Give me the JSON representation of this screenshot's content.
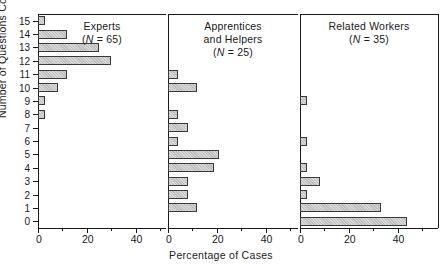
{
  "chart_data": {
    "type": "bar",
    "orientation": "horizontal",
    "title": "",
    "xlabel": "Percentage of Cases",
    "ylabel": "Number of Questions Correct",
    "xlim": [
      0,
      57
    ],
    "ylim": [
      -0.5,
      15.5
    ],
    "xticks": [
      0,
      20,
      40
    ],
    "xtick_labels": [
      "0",
      "20",
      "40"
    ],
    "x_minor_ticks": [
      10,
      30,
      50
    ],
    "yticks": [
      0,
      1,
      2,
      3,
      4,
      5,
      6,
      7,
      8,
      9,
      10,
      11,
      12,
      13,
      14,
      15
    ],
    "ytick_labels": [
      "0",
      "1",
      "2",
      "3",
      "4",
      "5",
      "6",
      "7",
      "8",
      "9",
      "10",
      "11",
      "12",
      "13",
      "14",
      "15"
    ],
    "grid": false,
    "legend": null,
    "categories": [
      0,
      1,
      2,
      3,
      4,
      5,
      6,
      7,
      8,
      9,
      10,
      11,
      12,
      13,
      14,
      15
    ],
    "panels": [
      {
        "name": "experts",
        "title_lines": [
          "Experts",
          "(N = 65)"
        ],
        "n_label": "(N = 65)",
        "n": 65,
        "values": [
          0,
          0,
          0,
          0,
          0,
          0,
          0,
          0,
          3,
          3,
          8,
          12,
          30,
          25,
          12,
          3
        ]
      },
      {
        "name": "apprentices-and-helpers",
        "title_lines": [
          "Apprentices",
          "and Helpers",
          "(N = 25)"
        ],
        "n_label": "(N = 25)",
        "n": 25,
        "values": [
          0,
          12,
          8,
          8,
          19,
          21,
          4,
          8,
          4,
          0,
          12,
          4,
          0,
          0,
          0,
          0
        ]
      },
      {
        "name": "related-workers",
        "title_lines": [
          "Related Workers",
          "(N = 35)"
        ],
        "n_label": "(N = 35)",
        "n": 35,
        "values": [
          44,
          33,
          3,
          8,
          3,
          0,
          3,
          0,
          0,
          3,
          0,
          0,
          0,
          0,
          0,
          0
        ]
      }
    ],
    "colors": {
      "bar_fill": "#cccccc",
      "bar_edge": "#3a3a3a",
      "axis": "#1a1a1a",
      "background": "#ffffff"
    }
  }
}
